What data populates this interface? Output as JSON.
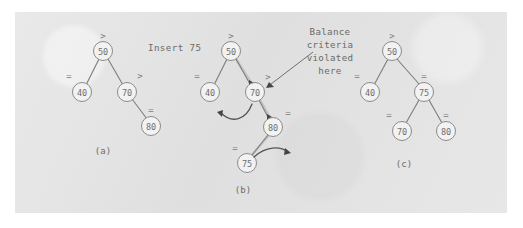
{
  "figure": {
    "background_color": "#ffffff",
    "panel_color": "#e2e2e2",
    "operation_label": "Insert 75",
    "annotation": {
      "lines": [
        "Balance",
        "criteria",
        "violated",
        "here"
      ],
      "target": "node-70"
    },
    "captions": {
      "a": "(a)",
      "b": "(b)",
      "c": "(c)"
    },
    "balance_symbols": {
      "right_heavy": ">",
      "balanced": "="
    }
  },
  "trees": {
    "a": {
      "caption": "(a)",
      "nodes": [
        {
          "id": "a50",
          "value": "50",
          "bf": ">",
          "cx": 103,
          "cy": 51,
          "bf_x": 103,
          "bf_y": 36
        },
        {
          "id": "a40",
          "value": "40",
          "bf": "=",
          "cx": 82,
          "cy": 92,
          "bf_x": 69,
          "bf_y": 76
        },
        {
          "id": "a70",
          "value": "70",
          "bf": ">",
          "cx": 127,
          "cy": 92,
          "bf_x": 140,
          "bf_y": 76
        },
        {
          "id": "a80",
          "value": "80",
          "bf": "=",
          "cx": 151,
          "cy": 126,
          "bf_x": 151,
          "bf_y": 110
        }
      ],
      "edges": [
        {
          "from": "a50",
          "to": "a40"
        },
        {
          "from": "a50",
          "to": "a70"
        },
        {
          "from": "a70",
          "to": "a80"
        }
      ],
      "caption_x": 103,
      "caption_y": 151
    },
    "b": {
      "caption": "(b)",
      "nodes": [
        {
          "id": "b50",
          "value": "50",
          "bf": ">",
          "cx": 231,
          "cy": 51,
          "bf_x": 231,
          "bf_y": 36
        },
        {
          "id": "b40",
          "value": "40",
          "bf": "=",
          "cx": 210,
          "cy": 92,
          "bf_x": 197,
          "bf_y": 76
        },
        {
          "id": "b70",
          "value": "70",
          "bf": ">",
          "cx": 255,
          "cy": 92,
          "bf_x": 268,
          "bf_y": 77
        },
        {
          "id": "b80",
          "value": "80",
          "bf": "=",
          "cx": 273,
          "cy": 127,
          "bf_x": 288,
          "bf_y": 113
        },
        {
          "id": "b75",
          "value": "75",
          "bf": "=",
          "cx": 247,
          "cy": 163,
          "bf_x": 235,
          "bf_y": 148
        }
      ],
      "edges": [
        {
          "from": "b50",
          "to": "b40"
        },
        {
          "from": "b50",
          "to": "b70"
        },
        {
          "from": "b70",
          "to": "b80"
        },
        {
          "from": "b80",
          "to": "b75"
        }
      ],
      "highlighted_path": [
        "b50",
        "b70",
        "b80",
        "b75"
      ],
      "rotation_arrows": [
        {
          "id": "rot-left-arrow",
          "direction": "left"
        },
        {
          "id": "rot-right-arrow",
          "direction": "right"
        }
      ],
      "caption_x": 243,
      "caption_y": 190
    },
    "c": {
      "caption": "(c)",
      "nodes": [
        {
          "id": "c50",
          "value": "50",
          "bf": ">",
          "cx": 392,
          "cy": 51,
          "bf_x": 392,
          "bf_y": 36
        },
        {
          "id": "c40",
          "value": "40",
          "bf": "=",
          "cx": 370,
          "cy": 92,
          "bf_x": 357,
          "bf_y": 76
        },
        {
          "id": "c75",
          "value": "75",
          "bf": "=",
          "cx": 424,
          "cy": 92,
          "bf_x": 424,
          "bf_y": 76
        },
        {
          "id": "c70",
          "value": "70",
          "bf": "=",
          "cx": 402,
          "cy": 131,
          "bf_x": 389,
          "bf_y": 115
        },
        {
          "id": "c80",
          "value": "80",
          "bf": "=",
          "cx": 446,
          "cy": 131,
          "bf_x": 446,
          "bf_y": 115
        }
      ],
      "edges": [
        {
          "from": "c50",
          "to": "c40"
        },
        {
          "from": "c50",
          "to": "c75"
        },
        {
          "from": "c75",
          "to": "c70"
        },
        {
          "from": "c75",
          "to": "c80"
        }
      ],
      "caption_x": 404,
      "caption_y": 164
    }
  }
}
